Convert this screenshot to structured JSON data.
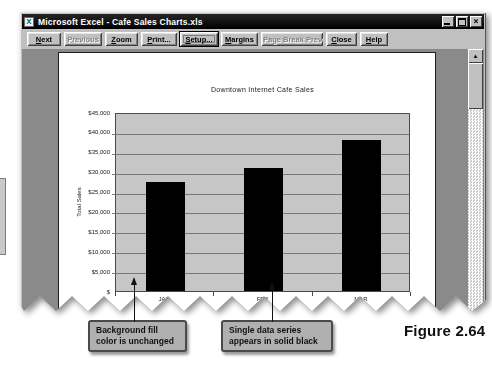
{
  "window": {
    "title": "Microsoft Excel - Cafe Sales Charts.xls",
    "app_icon_letter": "X",
    "controls": {
      "minimize": "minimize",
      "restore": "restore",
      "close": "close"
    }
  },
  "toolbar": {
    "buttons": [
      {
        "label": "Next",
        "enabled": true,
        "focused": false,
        "width": 34
      },
      {
        "label": "Previous",
        "enabled": false,
        "focused": false,
        "width": 38
      },
      {
        "label": "Zoom",
        "enabled": true,
        "focused": false,
        "width": 33
      },
      {
        "label": "Print...",
        "enabled": true,
        "focused": false,
        "width": 36
      },
      {
        "label": "Setup...",
        "enabled": true,
        "focused": true,
        "width": 38
      },
      {
        "label": "Margins",
        "enabled": true,
        "focused": false,
        "width": 37
      },
      {
        "label": "Page Break Preview",
        "enabled": false,
        "focused": false,
        "width": 62
      },
      {
        "label": "Close",
        "enabled": true,
        "focused": false,
        "width": 31
      },
      {
        "label": "Help",
        "enabled": true,
        "focused": false,
        "width": 28
      }
    ]
  },
  "preview": {
    "scrollbar": {
      "up_arrow": "▲"
    }
  },
  "chart_data": {
    "type": "bar",
    "title": "Downtown Internet Cafe Sales",
    "categories": [
      "JAN",
      "FEB",
      "MAR"
    ],
    "values": [
      27500,
      31000,
      38000
    ],
    "xlabel": "",
    "ylabel": "Total Sales",
    "ylim": [
      0,
      45000
    ],
    "ytick_step": 5000,
    "ytick_labels": [
      "$45,000",
      "$40,000",
      "$35,000",
      "$30,000",
      "$25,000",
      "$20,000",
      "$15,000",
      "$10,000",
      "$5,000",
      "$"
    ],
    "grid": true,
    "legend": "none",
    "bar_color": "#000000",
    "plot_bg": "#c6c6c6"
  },
  "annotations": {
    "callouts": [
      {
        "text": "Background fill color is unchanged"
      },
      {
        "text": "Single data series appears in solid black"
      }
    ],
    "figure_label": "Figure 2.64"
  }
}
